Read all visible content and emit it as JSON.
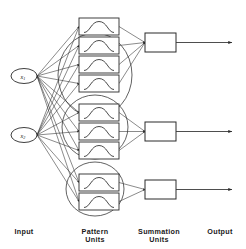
{
  "figure": {
    "type": "neural-network-architecture-diagram",
    "background_color": "#ffffff",
    "line_color": "#2a2a2a",
    "width": 246,
    "height": 249
  },
  "column_labels": [
    {
      "id": "input",
      "line1": "Input",
      "line2": "",
      "x": 74,
      "y": 232
    },
    {
      "id": "pattern",
      "line1": "Pattern",
      "line2": "Units",
      "x": 284,
      "y": 232
    },
    {
      "id": "summation",
      "line1": "Summation",
      "line2": "Units",
      "x": 474,
      "y": 232
    },
    {
      "id": "output",
      "line1": "Output",
      "line2": "",
      "x": 660,
      "y": 232
    }
  ],
  "input_layer": {
    "name": "Input",
    "nodes": [
      {
        "id": "x1",
        "label": "x",
        "subscript": "1",
        "cx": 24,
        "cy": 76,
        "rx": 13,
        "ry": 7.5
      },
      {
        "id": "x2",
        "label": "x",
        "subscript": "2",
        "cx": 24,
        "cy": 135,
        "rx": 13,
        "ry": 7.5
      }
    ]
  },
  "pattern_layer": {
    "name": "Pattern Units",
    "groups": [
      {
        "id": "group-1",
        "unit_count": 4,
        "ellipse": {
          "cx": 95,
          "cy": 75,
          "rx": 37,
          "ry": 42
        },
        "units": [
          {
            "id": "p1-1",
            "x": 79,
            "y": 18,
            "w": 40,
            "h": 17
          },
          {
            "id": "p1-2",
            "x": 79,
            "y": 37,
            "w": 40,
            "h": 17
          },
          {
            "id": "p1-3",
            "x": 79,
            "y": 56,
            "w": 40,
            "h": 17
          },
          {
            "id": "p1-4",
            "x": 79,
            "y": 75,
            "w": 40,
            "h": 17
          }
        ]
      },
      {
        "id": "group-2",
        "unit_count": 3,
        "ellipse": {
          "cx": 95,
          "cy": 127,
          "rx": 33,
          "ry": 32
        },
        "units": [
          {
            "id": "p2-1",
            "x": 79,
            "y": 104,
            "w": 40,
            "h": 17
          },
          {
            "id": "p2-2",
            "x": 79,
            "y": 123,
            "w": 40,
            "h": 17
          },
          {
            "id": "p2-3",
            "x": 79,
            "y": 142,
            "w": 40,
            "h": 17
          }
        ]
      },
      {
        "id": "group-3",
        "unit_count": 2,
        "ellipse": {
          "cx": 95,
          "cy": 189,
          "rx": 29,
          "ry": 27
        },
        "units": [
          {
            "id": "p3-1",
            "x": 79,
            "y": 174,
            "w": 40,
            "h": 17
          },
          {
            "id": "p3-2",
            "x": 79,
            "y": 193,
            "w": 40,
            "h": 17
          }
        ]
      }
    ],
    "unit_glyph": "gaussian-bell-curve"
  },
  "summation_layer": {
    "name": "Summation Units",
    "units": [
      {
        "id": "s1",
        "x": 145,
        "y": 33,
        "w": 31,
        "h": 19
      },
      {
        "id": "s2",
        "x": 145,
        "y": 122,
        "w": 31,
        "h": 19
      },
      {
        "id": "s3",
        "x": 145,
        "y": 180,
        "w": 31,
        "h": 19
      }
    ]
  },
  "output_layer": {
    "name": "Output",
    "arrows": [
      {
        "id": "o1",
        "x1": 176,
        "y1": 43,
        "x2": 232,
        "y2": 43
      },
      {
        "id": "o2",
        "x1": 176,
        "y1": 131,
        "x2": 232,
        "y2": 131
      },
      {
        "id": "o3",
        "x1": 176,
        "y1": 189,
        "x2": 232,
        "y2": 189
      }
    ]
  },
  "connections": {
    "description": "Each input node connects to every pattern unit; each pattern unit in a group converges to that group's summation unit; each summation unit emits one output.",
    "input_to_pattern_count": 18,
    "pattern_to_summation_count": 9,
    "summation_to_output_count": 3
  }
}
